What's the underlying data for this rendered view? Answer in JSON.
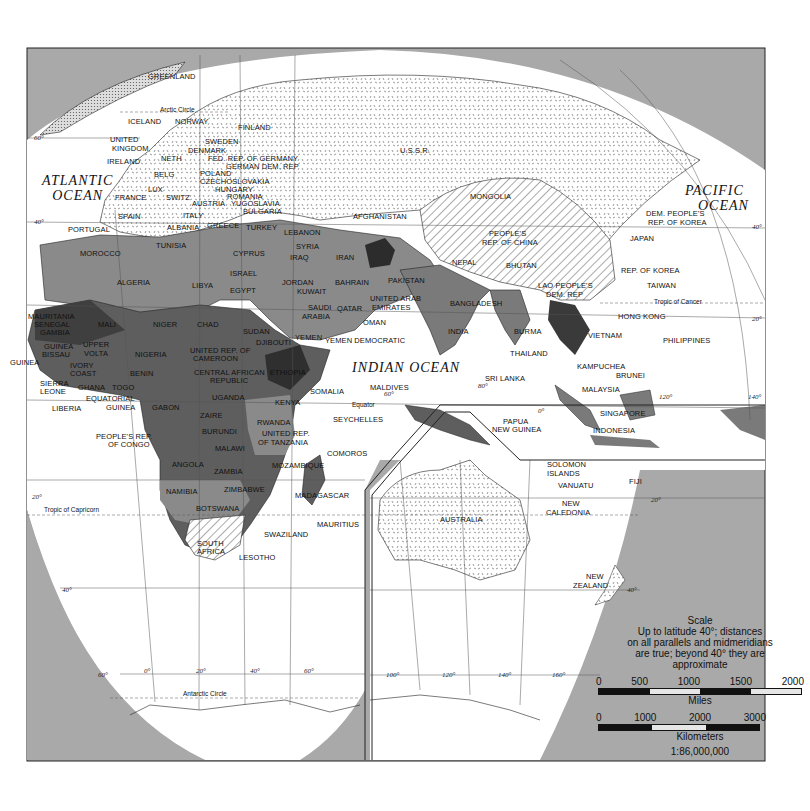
{
  "map": {
    "type": "political world map (Eastern Hemisphere, Africa/Asia/Oceania)",
    "colors": {
      "background_gray": "#a9a9a9",
      "ocean_white": "#ffffff",
      "shade_light": "#9a9a9a",
      "shade_medium": "#7a7a7a",
      "shade_dark": "#5e5e5e",
      "shade_darkest": "#3a3a3a",
      "pattern_stipple": "#ffffff",
      "pattern_hatch": "#ffffff"
    },
    "oceans": [
      {
        "id": "atlantic",
        "line1": "ATLANTIC",
        "line2": "OCEAN"
      },
      {
        "id": "pacific",
        "line1": "PACIFIC",
        "line2": "OCEAN"
      },
      {
        "id": "indian",
        "line1": "INDIAN OCEAN",
        "line2": ""
      }
    ],
    "lines": {
      "arctic_circle": "Arctic Circle",
      "tropic_cancer": "Tropic of Cancer",
      "equator": "Equator",
      "tropic_capricorn": "Tropic of Capricorn",
      "antarctic_circle": "Antarctic Circle"
    },
    "degree_labels": {
      "lat_60n_w": "60°",
      "lat_40n_w": "40°",
      "lat_40n_e": "40°",
      "lat_20n_w": "20°",
      "lat_20n_e": "20°",
      "lat_20s_w": "20°",
      "lat_20s_e": "20°",
      "lat_40s_w": "40°",
      "lat_40s_e": "40°",
      "lat_60s": "60°",
      "lon_0": "0°",
      "lon_20": "20°",
      "lon_40": "40°",
      "lon_60": "60°",
      "lon_60_mid": "60°",
      "lon_80": "80°",
      "lon_100": "100°",
      "lon_120": "120°",
      "lon_120_n": "120°",
      "lon_140": "140°",
      "lon_140_n": "140°",
      "lon_160": "160°",
      "lat_0": "0°"
    },
    "countries": [
      {
        "name": "GREENLAND",
        "x": 148,
        "y": 73
      },
      {
        "name": "ICELAND",
        "x": 128,
        "y": 118
      },
      {
        "name": "NORWAY",
        "x": 175,
        "y": 118
      },
      {
        "name": "FINLAND",
        "x": 238,
        "y": 124
      },
      {
        "name": "UNITED",
        "x": 110,
        "y": 136
      },
      {
        "name": "KINGDOM",
        "x": 112,
        "y": 145
      },
      {
        "name": "SWEDEN",
        "x": 205,
        "y": 138
      },
      {
        "name": "DENMARK",
        "x": 188,
        "y": 147
      },
      {
        "name": "IRELAND",
        "x": 107,
        "y": 158
      },
      {
        "name": "NETH",
        "x": 161,
        "y": 155
      },
      {
        "name": "FED. REP. OF GERMANY",
        "x": 208,
        "y": 155
      },
      {
        "name": "GERMAN DEM. REP",
        "x": 226,
        "y": 163
      },
      {
        "name": "BELG",
        "x": 154,
        "y": 171
      },
      {
        "name": "POLAND",
        "x": 200,
        "y": 170
      },
      {
        "name": "CZECHOSLOVAKIA",
        "x": 200,
        "y": 178
      },
      {
        "name": "LUX",
        "x": 148,
        "y": 186
      },
      {
        "name": "HUNGARY",
        "x": 215,
        "y": 186
      },
      {
        "name": "FRANCE",
        "x": 115,
        "y": 194
      },
      {
        "name": "SWITZ",
        "x": 166,
        "y": 194
      },
      {
        "name": "ROMANIA",
        "x": 227,
        "y": 193
      },
      {
        "name": "AUSTRIA",
        "x": 192,
        "y": 200
      },
      {
        "name": "YUGOSLAVIA",
        "x": 231,
        "y": 200
      },
      {
        "name": "BULGARIA",
        "x": 243,
        "y": 208
      },
      {
        "name": "SPAIN",
        "x": 118,
        "y": 213
      },
      {
        "name": "ITALY",
        "x": 183,
        "y": 212
      },
      {
        "name": "PORTUGAL",
        "x": 68,
        "y": 226
      },
      {
        "name": "ALBANIA",
        "x": 167,
        "y": 224
      },
      {
        "name": "GREECE",
        "x": 207,
        "y": 222
      },
      {
        "name": "TURKEY",
        "x": 246,
        "y": 224
      },
      {
        "name": "LEBANON",
        "x": 284,
        "y": 229
      },
      {
        "name": "U.S.S.R.",
        "x": 400,
        "y": 147
      },
      {
        "name": "MONGOLIA",
        "x": 470,
        "y": 193
      },
      {
        "name": "AFGHANISTAN",
        "x": 353,
        "y": 213
      },
      {
        "name": "PEOPLE'S",
        "x": 489,
        "y": 230
      },
      {
        "name": "REP. OF CHINA",
        "x": 482,
        "y": 239
      },
      {
        "name": "DEM. PEOPLE'S",
        "x": 646,
        "y": 210
      },
      {
        "name": "REP. OF KOREA",
        "x": 648,
        "y": 219
      },
      {
        "name": "JAPAN",
        "x": 630,
        "y": 235
      },
      {
        "name": "MOROCCO",
        "x": 80,
        "y": 250
      },
      {
        "name": "TUNISIA",
        "x": 156,
        "y": 242
      },
      {
        "name": "SYRIA",
        "x": 296,
        "y": 243
      },
      {
        "name": "CYPRUS",
        "x": 233,
        "y": 250
      },
      {
        "name": "IRAQ",
        "x": 290,
        "y": 254
      },
      {
        "name": "IRAN",
        "x": 336,
        "y": 254
      },
      {
        "name": "NEPAL",
        "x": 452,
        "y": 259
      },
      {
        "name": "BHUTAN",
        "x": 506,
        "y": 262
      },
      {
        "name": "PAKISTAN",
        "x": 388,
        "y": 277
      },
      {
        "name": "ALGERIA",
        "x": 117,
        "y": 279
      },
      {
        "name": "LIBYA",
        "x": 192,
        "y": 282
      },
      {
        "name": "ISRAEL",
        "x": 230,
        "y": 270
      },
      {
        "name": "JORDAN",
        "x": 282,
        "y": 279
      },
      {
        "name": "EGYPT",
        "x": 230,
        "y": 287
      },
      {
        "name": "KUWAIT",
        "x": 297,
        "y": 288
      },
      {
        "name": "BAHRAIN",
        "x": 335,
        "y": 279
      },
      {
        "name": "REP. OF KOREA",
        "x": 621,
        "y": 267
      },
      {
        "name": "TAIWAN",
        "x": 647,
        "y": 282
      },
      {
        "name": "LAO PEOPLE'S",
        "x": 538,
        "y": 282
      },
      {
        "name": "DEM. REP",
        "x": 546,
        "y": 291
      },
      {
        "name": "BANGLADESH",
        "x": 450,
        "y": 300
      },
      {
        "name": "UNITED ARAB",
        "x": 370,
        "y": 295
      },
      {
        "name": "EMIRATES",
        "x": 372,
        "y": 304
      },
      {
        "name": "SAUDI",
        "x": 308,
        "y": 304
      },
      {
        "name": "ARABIA",
        "x": 302,
        "y": 313
      },
      {
        "name": "QATAR",
        "x": 337,
        "y": 305
      },
      {
        "name": "HONG KONG",
        "x": 618,
        "y": 313
      },
      {
        "name": "OMAN",
        "x": 363,
        "y": 319
      },
      {
        "name": "MAURITANIA",
        "x": 28,
        "y": 313
      },
      {
        "name": "SENEGAL",
        "x": 34,
        "y": 321
      },
      {
        "name": "MALI",
        "x": 98,
        "y": 321
      },
      {
        "name": "NIGER",
        "x": 153,
        "y": 321
      },
      {
        "name": "CHAD",
        "x": 197,
        "y": 321
      },
      {
        "name": "GAMBIA",
        "x": 40,
        "y": 329
      },
      {
        "name": "SUDAN",
        "x": 243,
        "y": 328
      },
      {
        "name": "INDIA",
        "x": 448,
        "y": 328
      },
      {
        "name": "BURMA",
        "x": 514,
        "y": 328
      },
      {
        "name": "VIETNAM",
        "x": 588,
        "y": 332
      },
      {
        "name": "PHILIPPINES",
        "x": 663,
        "y": 337
      },
      {
        "name": "YEMEN",
        "x": 295,
        "y": 334
      },
      {
        "name": "DJIBOUTI",
        "x": 256,
        "y": 339
      },
      {
        "name": "YEMEN DEMOCRATIC",
        "x": 325,
        "y": 337
      },
      {
        "name": "GUINEA",
        "x": 44,
        "y": 343
      },
      {
        "name": "UPPER",
        "x": 83,
        "y": 341
      },
      {
        "name": "BISSAU",
        "x": 42,
        "y": 351
      },
      {
        "name": "VOLTA",
        "x": 84,
        "y": 350
      },
      {
        "name": "NIGERIA",
        "x": 135,
        "y": 351
      },
      {
        "name": "UNITED REP. OF",
        "x": 190,
        "y": 347
      },
      {
        "name": "CAMEROON",
        "x": 193,
        "y": 355
      },
      {
        "name": "THAILAND",
        "x": 510,
        "y": 350
      },
      {
        "name": "GUINEA",
        "x": 10,
        "y": 359
      },
      {
        "name": "IVORY",
        "x": 70,
        "y": 362
      },
      {
        "name": "COAST",
        "x": 70,
        "y": 370
      },
      {
        "name": "BENIN",
        "x": 130,
        "y": 370
      },
      {
        "name": "CENTRAL AFRICAN",
        "x": 194,
        "y": 369
      },
      {
        "name": "REPUBLIC",
        "x": 210,
        "y": 377
      },
      {
        "name": "ETHIOPIA",
        "x": 270,
        "y": 369
      },
      {
        "name": "KAMPUCHEA",
        "x": 577,
        "y": 363
      },
      {
        "name": "SRI LANKA",
        "x": 485,
        "y": 375
      },
      {
        "name": "BRUNEI",
        "x": 616,
        "y": 372
      },
      {
        "name": "SIERRA",
        "x": 40,
        "y": 380
      },
      {
        "name": "LEONE",
        "x": 40,
        "y": 388
      },
      {
        "name": "GHANA",
        "x": 78,
        "y": 384
      },
      {
        "name": "TOGO",
        "x": 112,
        "y": 384
      },
      {
        "name": "MALDIVES",
        "x": 370,
        "y": 384
      },
      {
        "name": "SOMALIA",
        "x": 310,
        "y": 388
      },
      {
        "name": "MALAYSIA",
        "x": 582,
        "y": 386
      },
      {
        "name": "EQUATORIAL",
        "x": 86,
        "y": 395
      },
      {
        "name": "UGANDA",
        "x": 212,
        "y": 394
      },
      {
        "name": "KENYA",
        "x": 275,
        "y": 399
      },
      {
        "name": "GUINEA",
        "x": 106,
        "y": 404
      },
      {
        "name": "LIBERIA",
        "x": 52,
        "y": 405
      },
      {
        "name": "GABON",
        "x": 152,
        "y": 404
      },
      {
        "name": "SEYCHELLES",
        "x": 333,
        "y": 416
      },
      {
        "name": "PAPUA",
        "x": 503,
        "y": 418
      },
      {
        "name": "SINGAPORE",
        "x": 600,
        "y": 410
      },
      {
        "name": "ZAIRE",
        "x": 200,
        "y": 412
      },
      {
        "name": "NEW GUINEA",
        "x": 492,
        "y": 426
      },
      {
        "name": "INDONESIA",
        "x": 593,
        "y": 427
      },
      {
        "name": "RWANDA",
        "x": 257,
        "y": 419
      },
      {
        "name": "BURUNDI",
        "x": 202,
        "y": 428
      },
      {
        "name": "UNITED REP.",
        "x": 262,
        "y": 430
      },
      {
        "name": "PEOPLE'S REP.",
        "x": 96,
        "y": 433
      },
      {
        "name": "OF TANZANIA",
        "x": 258,
        "y": 439
      },
      {
        "name": "OF CONGO",
        "x": 108,
        "y": 441
      },
      {
        "name": "MALAWI",
        "x": 215,
        "y": 445
      },
      {
        "name": "COMOROS",
        "x": 327,
        "y": 450
      },
      {
        "name": "SOLOMON",
        "x": 547,
        "y": 461
      },
      {
        "name": "ISLANDS",
        "x": 547,
        "y": 470
      },
      {
        "name": "ANGOLA",
        "x": 172,
        "y": 461
      },
      {
        "name": "MOZAMBIQUE",
        "x": 272,
        "y": 462
      },
      {
        "name": "ZAMBIA",
        "x": 214,
        "y": 468
      },
      {
        "name": "VANUATU",
        "x": 558,
        "y": 482
      },
      {
        "name": "FIJI",
        "x": 629,
        "y": 478
      },
      {
        "name": "ZIMBABWE",
        "x": 224,
        "y": 486
      },
      {
        "name": "NAMIBIA",
        "x": 166,
        "y": 488
      },
      {
        "name": "MADAGASCAR",
        "x": 295,
        "y": 492
      },
      {
        "name": "NEW",
        "x": 562,
        "y": 500
      },
      {
        "name": "CALEDONIA",
        "x": 546,
        "y": 509
      },
      {
        "name": "AUSTRALIA",
        "x": 440,
        "y": 516
      },
      {
        "name": "BOTSWANA",
        "x": 196,
        "y": 505
      },
      {
        "name": "MAURITIUS",
        "x": 317,
        "y": 521
      },
      {
        "name": "SWAZILAND",
        "x": 264,
        "y": 531
      },
      {
        "name": "SOUTH",
        "x": 197,
        "y": 540
      },
      {
        "name": "AFRICA",
        "x": 197,
        "y": 548
      },
      {
        "name": "LESOTHO",
        "x": 239,
        "y": 554
      },
      {
        "name": "NEW",
        "x": 586,
        "y": 573
      },
      {
        "name": "ZEALAND",
        "x": 573,
        "y": 582
      }
    ],
    "scale": {
      "title": "Scale",
      "note_line1": "Up to latitude 40°; distances",
      "note_line2": "on all parallels and midmeridians",
      "note_line3": "are true; beyond 40° they are",
      "note_line4": "approximate",
      "miles_ticks": [
        "0",
        "500",
        "1000",
        "1500",
        "2000"
      ],
      "miles_label": "Miles",
      "km_ticks": [
        "0",
        "1000",
        "2000",
        "3000"
      ],
      "km_label": "Kilometers",
      "ratio": "1:86,000,000"
    }
  }
}
